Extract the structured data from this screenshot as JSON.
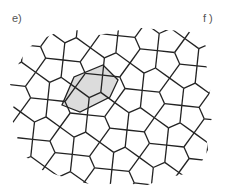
{
  "labels": {
    "left": "e)",
    "right": "f )"
  },
  "diagram": {
    "type": "cairo-pentagonal-tiling",
    "stroke_color": "#222222",
    "highlight_fill": "#dcdcdc",
    "highlight_shape": "hexagon",
    "highlight_vertices": [
      [
        103,
        65
      ],
      [
        118,
        80
      ],
      [
        110,
        97
      ],
      [
        80,
        112
      ],
      [
        62,
        105
      ],
      [
        74,
        77
      ]
    ]
  }
}
